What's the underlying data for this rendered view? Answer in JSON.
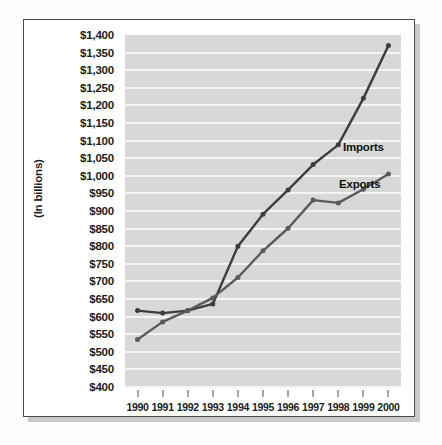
{
  "chart_data": {
    "type": "line",
    "title": "",
    "xlabel": "",
    "ylabel": "(In billions)",
    "categories": [
      "1990",
      "1991",
      "1992",
      "1993",
      "1994",
      "1995",
      "1996",
      "1997",
      "1998",
      "1999",
      "2000"
    ],
    "x": [
      1990,
      1991,
      1992,
      1993,
      1994,
      1995,
      1996,
      1997,
      1998,
      1999,
      2000
    ],
    "ylim": [
      400,
      1400
    ],
    "ytick_step": 50,
    "ytick_labels": [
      "$1,400",
      "$1,350",
      "$1,300",
      "$1,250",
      "$1,200",
      "$1,150",
      "$1,100",
      "$1,050",
      "$1,000",
      "$950",
      "$900",
      "$850",
      "$800",
      "$750",
      "$700",
      "$650",
      "$600",
      "$550",
      "$500",
      "$450",
      "$400"
    ],
    "ytick_values": [
      1400,
      1350,
      1300,
      1250,
      1200,
      1150,
      1100,
      1050,
      1000,
      950,
      900,
      850,
      800,
      750,
      700,
      650,
      600,
      550,
      500,
      450,
      400
    ],
    "grid": true,
    "grid_orientation": "horizontal",
    "legend_position": "inline-right",
    "series": [
      {
        "name": "Imports",
        "color": "#3d3d3d",
        "values": [
          617,
          610,
          617,
          636,
          800,
          891,
          960,
          1032,
          1088,
          1220,
          1370
        ]
      },
      {
        "name": "Exports",
        "color": "#5a5a5a",
        "values": [
          535,
          585,
          617,
          653,
          711,
          787,
          851,
          931,
          923,
          962,
          1005
        ]
      }
    ],
    "annotations": [
      {
        "text": "Imports",
        "series": "Imports"
      },
      {
        "text": "Exports",
        "series": "Exports"
      }
    ],
    "colors": {
      "plot_background": "#d8d8d8",
      "gridline": "#f4f4f4",
      "frame_border": "#4a4a4a",
      "text": "#1c1c1c",
      "page_background": "#ffffff"
    }
  }
}
